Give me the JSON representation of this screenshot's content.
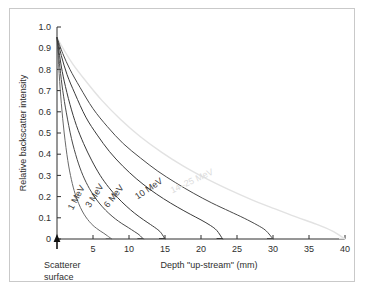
{
  "figure": {
    "border_color": "#c9c9c9",
    "background": "#ffffff"
  },
  "annotations": {
    "scatterer_line1": "Scatterer",
    "scatterer_line2": "surface",
    "origin_marker": "up-arrow-marker"
  },
  "chart_data": {
    "type": "line",
    "title": "",
    "xlabel": "Depth \"up-stream\" (mm)",
    "ylabel": "Relative backscatter intensity",
    "xlim": [
      0,
      40
    ],
    "ylim": [
      0,
      1.0
    ],
    "grid": false,
    "legend_position": "inline-curve-labels",
    "xticks": [
      0,
      5,
      10,
      15,
      20,
      25,
      30,
      35,
      40
    ],
    "xticklabels": [
      "",
      "5",
      "10",
      "15",
      "20",
      "25",
      "30",
      "35",
      "40"
    ],
    "yticks": [
      0,
      0.1,
      0.2,
      0.3,
      0.4,
      0.5,
      0.6,
      0.7,
      0.8,
      0.9,
      1.0
    ],
    "yticklabels": [
      "0",
      "0.1",
      "0.2",
      "0.3",
      "0.4",
      "0.5",
      "0.6",
      "0.7",
      "0.8",
      "0.9",
      "1.0"
    ],
    "y_at_origin": 0.95,
    "series": [
      {
        "name": "1 MeV",
        "label": "1 MeV",
        "color": "#6a6a6a",
        "stroke_width": 1.0,
        "label_rotation": -62,
        "label_x": 2.2,
        "label_y": 0.135,
        "x_end": 7.6,
        "x": [
          0,
          0.3,
          0.6,
          1.0,
          1.5,
          2.0,
          2.5,
          3.0,
          3.5,
          4.0,
          4.5,
          5.0,
          5.5,
          6.0,
          6.5,
          7.0,
          7.6
        ],
        "y": [
          0.95,
          0.78,
          0.64,
          0.5,
          0.37,
          0.28,
          0.215,
          0.168,
          0.132,
          0.104,
          0.082,
          0.064,
          0.05,
          0.038,
          0.027,
          0.015,
          0.0
        ]
      },
      {
        "name": "3 MeV",
        "label": "3 MeV",
        "color": "#4a4a4a",
        "stroke_width": 1.0,
        "label_rotation": -58,
        "label_x": 4.6,
        "label_y": 0.145,
        "x_end": 12.0,
        "x": [
          0,
          0.4,
          0.8,
          1.3,
          2.0,
          2.8,
          3.6,
          4.5,
          5.4,
          6.3,
          7.2,
          8.1,
          9.0,
          9.9,
          10.8,
          11.4,
          12.0
        ],
        "y": [
          0.95,
          0.81,
          0.7,
          0.595,
          0.475,
          0.375,
          0.3,
          0.238,
          0.19,
          0.152,
          0.121,
          0.095,
          0.073,
          0.054,
          0.034,
          0.02,
          0.0
        ]
      },
      {
        "name": "6 MeV",
        "label": "6 MeV",
        "color": "#3a3a3a",
        "stroke_width": 1.0,
        "label_rotation": -52,
        "label_x": 7.1,
        "label_y": 0.145,
        "x_end": 15.0,
        "x": [
          0,
          0.5,
          1.0,
          1.8,
          2.7,
          3.7,
          4.8,
          6.0,
          7.2,
          8.4,
          9.6,
          10.8,
          12.0,
          13.0,
          14.0,
          14.5,
          15.0
        ],
        "y": [
          0.95,
          0.835,
          0.745,
          0.635,
          0.535,
          0.45,
          0.372,
          0.3,
          0.243,
          0.196,
          0.156,
          0.121,
          0.091,
          0.068,
          0.044,
          0.027,
          0.0
        ]
      },
      {
        "name": "10 MeV",
        "label": "10 MeV",
        "color": "#3a3a3a",
        "stroke_width": 1.0,
        "label_rotation": -34,
        "label_x": 11.2,
        "label_y": 0.185,
        "x_end": 23.0,
        "x": [
          0,
          0.6,
          1.4,
          2.5,
          4.0,
          5.6,
          7.3,
          9.1,
          11.0,
          12.9,
          14.8,
          16.7,
          18.5,
          20.0,
          21.3,
          22.2,
          23.0
        ],
        "y": [
          0.95,
          0.865,
          0.775,
          0.685,
          0.575,
          0.49,
          0.412,
          0.345,
          0.285,
          0.234,
          0.19,
          0.151,
          0.117,
          0.09,
          0.064,
          0.04,
          0.0
        ]
      },
      {
        "name": "10 MeV outer",
        "label": "",
        "color": "#4a4a4a",
        "stroke_width": 1.0,
        "label_rotation": 0,
        "label_x": 0,
        "label_y": 0,
        "x_end": 30.0,
        "x": [
          0,
          0.8,
          1.8,
          3.2,
          5.0,
          7.0,
          9.2,
          11.6,
          14.0,
          16.5,
          19.0,
          21.5,
          24.0,
          26.0,
          27.8,
          29.0,
          30.0
        ],
        "y": [
          0.95,
          0.875,
          0.8,
          0.715,
          0.615,
          0.53,
          0.45,
          0.382,
          0.32,
          0.265,
          0.215,
          0.17,
          0.13,
          0.098,
          0.066,
          0.04,
          0.0
        ]
      },
      {
        "name": "14-25 MeV",
        "label": "14–25 MeV",
        "color": "#e2e2e2",
        "stroke_width": 1.4,
        "label_rotation": -25,
        "label_x": 16.0,
        "label_y": 0.215,
        "x_end": 40.0,
        "x": [
          0,
          1.0,
          2.2,
          4.0,
          6.2,
          8.8,
          11.5,
          14.5,
          17.5,
          20.6,
          23.8,
          27.0,
          30.2,
          33.2,
          36.0,
          38.2,
          40.0
        ],
        "y": [
          0.95,
          0.89,
          0.825,
          0.745,
          0.655,
          0.565,
          0.485,
          0.41,
          0.345,
          0.287,
          0.234,
          0.186,
          0.143,
          0.104,
          0.07,
          0.038,
          0.0
        ]
      }
    ]
  }
}
